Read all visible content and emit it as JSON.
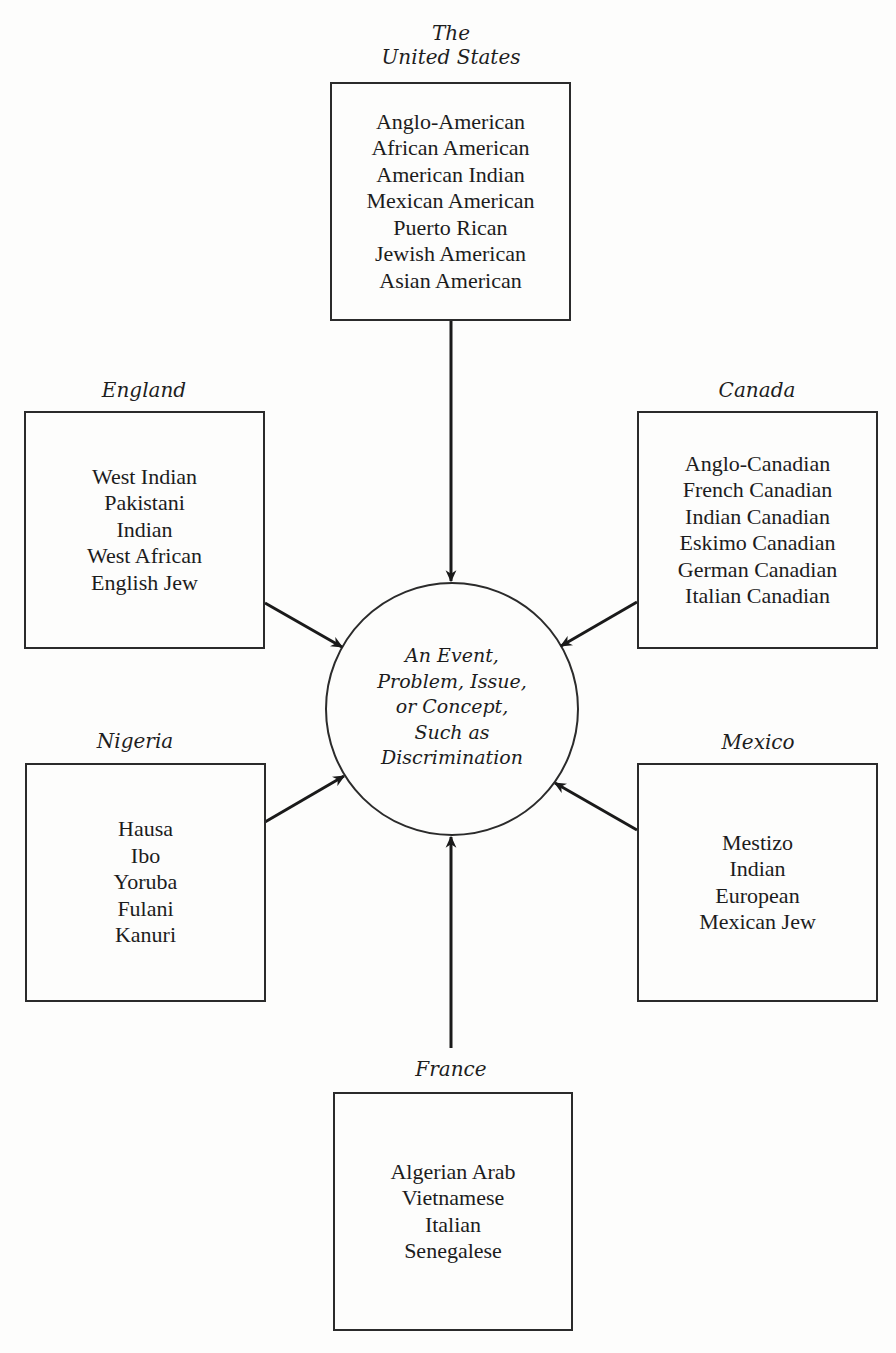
{
  "diagram": {
    "center": {
      "lines": [
        "An Event,",
        "Problem, Issue,",
        "or Concept,",
        "Such as",
        "Discrimination"
      ]
    },
    "nodes": {
      "united_states": {
        "label_lines": [
          "The",
          "United States"
        ],
        "groups": [
          "Anglo-American",
          "African American",
          "American Indian",
          "Mexican American",
          "Puerto Rican",
          "Jewish American",
          "Asian American"
        ]
      },
      "england": {
        "label": "England",
        "groups": [
          "West Indian",
          "Pakistani",
          "Indian",
          "West African",
          "English Jew"
        ]
      },
      "canada": {
        "label": "Canada",
        "groups": [
          "Anglo-Canadian",
          "French Canadian",
          "Indian Canadian",
          "Eskimo Canadian",
          "German Canadian",
          "Italian Canadian"
        ]
      },
      "nigeria": {
        "label": "Nigeria",
        "groups": [
          "Hausa",
          "Ibo",
          "Yoruba",
          "Fulani",
          "Kanuri"
        ]
      },
      "mexico": {
        "label": "Mexico",
        "groups": [
          "Mestizo",
          "Indian",
          "European",
          "Mexican Jew"
        ]
      },
      "france": {
        "label": "France",
        "groups": [
          "Algerian Arab",
          "Vietnamese",
          "Italian",
          "Senegalese"
        ]
      }
    },
    "edges": [
      {
        "from": "united_states",
        "to": "center"
      },
      {
        "from": "england",
        "to": "center"
      },
      {
        "from": "canada",
        "to": "center"
      },
      {
        "from": "nigeria",
        "to": "center"
      },
      {
        "from": "mexico",
        "to": "center"
      },
      {
        "from": "france",
        "to": "center"
      }
    ],
    "colors": {
      "line": "#1a1a1a",
      "background": "#fdfdfc"
    }
  }
}
